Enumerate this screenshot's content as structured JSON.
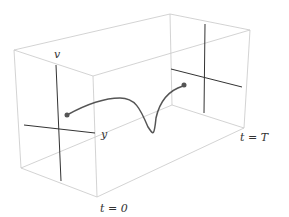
{
  "diagram": {
    "labels": {
      "v_axis": "v",
      "y_axis": "y",
      "t_start": "t = 0",
      "t_end": "t = T"
    },
    "colors": {
      "box": "#c8c8c8",
      "axes": "#333333",
      "curve": "#555555",
      "points": "#555555"
    }
  }
}
